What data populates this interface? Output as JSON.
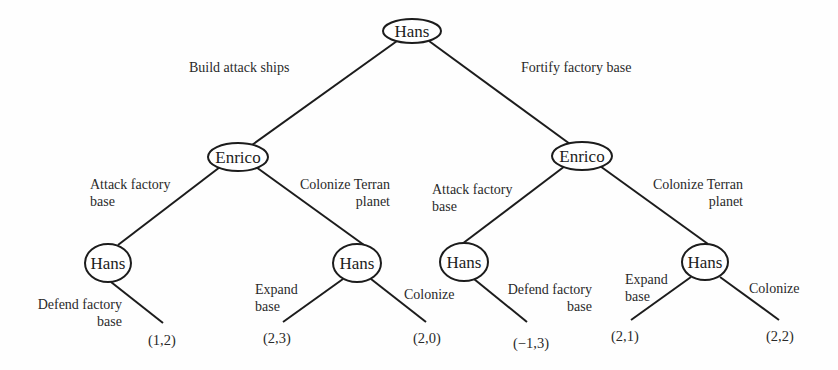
{
  "nodes": {
    "root": {
      "label": "Hans"
    },
    "enrico_left": {
      "label": "Enrico"
    },
    "enrico_right": {
      "label": "Enrico"
    },
    "hans_ll": {
      "label": "Hans"
    },
    "hans_lr": {
      "label": "Hans"
    },
    "hans_rl": {
      "label": "Hans"
    },
    "hans_rr": {
      "label": "Hans"
    }
  },
  "edges": {
    "build_attack_ships": {
      "label": "Build attack ships"
    },
    "fortify_factory_base": {
      "label": "Fortify factory base"
    },
    "left_attack_factory": {
      "line1": "Attack factory",
      "line2": "base"
    },
    "left_colonize_terran": {
      "line1": "Colonize  Terran",
      "line2": "planet"
    },
    "right_attack_factory": {
      "line1": "Attack factory",
      "line2": "base"
    },
    "right_colonize_terran": {
      "line1": "Colonize  Terran",
      "line2": "planet"
    },
    "ll_defend": {
      "line1": "Defend factory",
      "line2": "base"
    },
    "lr_expand": {
      "line1": "Expand",
      "line2": "base"
    },
    "lr_colonize": {
      "label": "Colonize"
    },
    "rl_defend": {
      "line1": "Defend factory",
      "line2": "base"
    },
    "rr_expand": {
      "line1": "Expand",
      "line2": "base"
    },
    "rr_colonize": {
      "label": "Colonize"
    }
  },
  "payoffs": {
    "ll_defend": "(1,2)",
    "lr_expand": "(2,3)",
    "lr_colonize": "(2,0)",
    "rl_defend": "(−1,3)",
    "rr_expand": "(2,1)",
    "rr_colonize": "(2,2)"
  }
}
